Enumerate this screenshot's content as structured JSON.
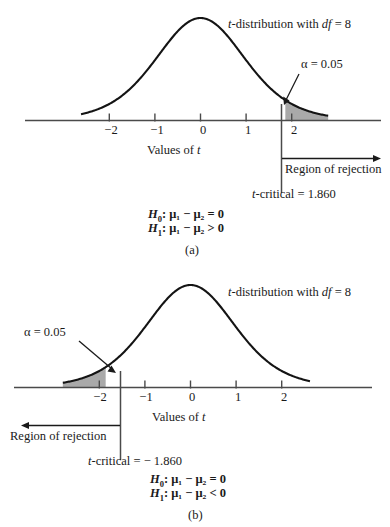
{
  "figure": {
    "shade_color": "#a9a9a9",
    "curve_color": "#141414",
    "axis_color": "#4a4a4a"
  },
  "panels": [
    {
      "tag": "(a)",
      "title_prefix": "t",
      "title_main": "-distribution with ",
      "title_df": "df",
      "title_eq": " = 8",
      "axis_label_prefix": "Values of ",
      "axis_label_var": "t",
      "tick_labels": [
        "−2",
        "−1",
        "0",
        "1",
        "2"
      ],
      "tick_values": [
        -2,
        -1,
        0,
        1,
        2
      ],
      "alpha_label": "α = 0.05",
      "alpha_value": 0.05,
      "region_label": "Region of rejection",
      "region_direction": "right",
      "tcritical_label": "t-critical = 1.860",
      "tcritical_prefix": "t",
      "tcritical_rest": "-critical = 1.860",
      "tcritical_value": 1.86,
      "hypotheses": [
        {
          "name": "H",
          "sub": "0",
          "statement": ": μ₁ − μ₂ = 0"
        },
        {
          "name": "H",
          "sub": "1",
          "statement": ": μ₁ − μ₂ > 0"
        }
      ]
    },
    {
      "tag": "(b)",
      "title_prefix": "t",
      "title_main": "-distribution with ",
      "title_df": "df",
      "title_eq": " = 8",
      "axis_label_prefix": "Values of ",
      "axis_label_var": "t",
      "tick_labels": [
        "−2",
        "−1",
        "0",
        "1",
        "2"
      ],
      "tick_values": [
        -2,
        -1,
        0,
        1,
        2
      ],
      "alpha_label": "α = 0.05",
      "alpha_value": 0.05,
      "region_label": "Region of rejection",
      "region_direction": "left",
      "tcritical_label": "t-critical = − 1.860",
      "tcritical_prefix": "t",
      "tcritical_rest": "-critical = − 1.860",
      "tcritical_value": -1.86,
      "hypotheses": [
        {
          "name": "H",
          "sub": "0",
          "statement": ": μ₁ − μ₂ = 0"
        },
        {
          "name": "H",
          "sub": "1",
          "statement": ": μ₁ − μ₂ < 0"
        }
      ]
    }
  ],
  "chart_data": {
    "type": "line",
    "title": "t-distribution with df = 8",
    "xlabel": "Values of t",
    "ylabel": "",
    "xlim": [
      -3.2,
      3.2
    ],
    "ylim": [
      0,
      0.4
    ],
    "grid": false,
    "legend": null,
    "distribution": "Student t",
    "df": 8,
    "xticks": [
      -2,
      -1,
      0,
      1,
      2
    ],
    "xticklabels": [
      "−2",
      "−1",
      "0",
      "1",
      "2"
    ],
    "series": [
      {
        "name": "t density (panel a)",
        "x": [
          -3.2,
          -3.0,
          -2.8,
          -2.6,
          -2.4,
          -2.2,
          -2.0,
          -1.8,
          -1.6,
          -1.4,
          -1.2,
          -1.0,
          -0.8,
          -0.6,
          -0.4,
          -0.2,
          0.0,
          0.2,
          0.4,
          0.6,
          0.8,
          1.0,
          1.2,
          1.4,
          1.6,
          1.8,
          2.0,
          2.2,
          2.4,
          2.6,
          2.8,
          3.0,
          3.2
        ],
        "y": [
          0.0103,
          0.0141,
          0.0192,
          0.026,
          0.0349,
          0.0464,
          0.0611,
          0.0794,
          0.1016,
          0.1277,
          0.1571,
          0.1884,
          0.2196,
          0.2482,
          0.2716,
          0.2877,
          0.2935,
          0.2877,
          0.2716,
          0.2482,
          0.2196,
          0.1884,
          0.1571,
          0.1277,
          0.1016,
          0.0794,
          0.0611,
          0.0464,
          0.0349,
          0.026,
          0.0192,
          0.0141,
          0.0103
        ]
      }
    ],
    "annotations": [
      {
        "panel": "(a)",
        "text": "α = 0.05",
        "region": "right tail",
        "from_x": 1.86,
        "to_x": 3.2,
        "area": 0.05
      },
      {
        "panel": "(a)",
        "text": "t-critical = 1.860",
        "x": 1.86
      },
      {
        "panel": "(a)",
        "text": "Region of rejection",
        "direction": "right"
      },
      {
        "panel": "(a)",
        "text": "H0: μ1 − μ2 = 0"
      },
      {
        "panel": "(a)",
        "text": "H1: μ1 − μ2 > 0"
      },
      {
        "panel": "(b)",
        "text": "α = 0.05",
        "region": "left tail",
        "from_x": -3.2,
        "to_x": -1.86,
        "area": 0.05
      },
      {
        "panel": "(b)",
        "text": "t-critical = − 1.860",
        "x": -1.86
      },
      {
        "panel": "(b)",
        "text": "Region of rejection",
        "direction": "left"
      },
      {
        "panel": "(b)",
        "text": "H0: μ1 − μ2 = 0"
      },
      {
        "panel": "(b)",
        "text": "H1: μ1 − μ2 < 0"
      }
    ]
  }
}
